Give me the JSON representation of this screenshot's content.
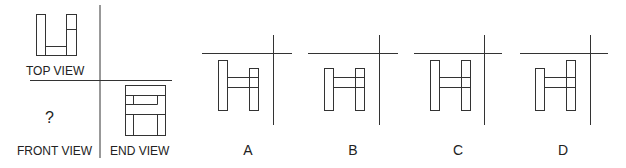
{
  "puzzle": {
    "views": {
      "top_label": "TOP VIEW",
      "front_label": "FRONT VIEW",
      "end_label": "END VIEW",
      "unknown_marker": "?"
    },
    "options": [
      {
        "label": "A"
      },
      {
        "label": "B"
      },
      {
        "label": "C"
      },
      {
        "label": "D"
      }
    ],
    "colors": {
      "line": "#333333",
      "background": "#ffffff"
    }
  }
}
